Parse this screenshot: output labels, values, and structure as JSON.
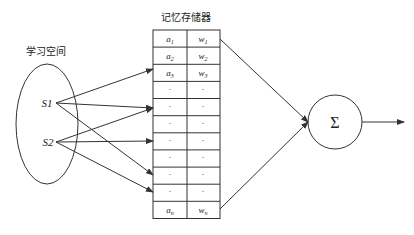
{
  "diagram": {
    "memory_title": "记忆存储器",
    "learning_space_label": "学习空间",
    "inputs": [
      {
        "label": "S",
        "suffix": "1"
      },
      {
        "label": "S",
        "suffix": "2"
      }
    ],
    "memory_rows": [
      {
        "a": "a",
        "a_sub": "1",
        "w": "w",
        "w_sub": "1"
      },
      {
        "a": "a",
        "a_sub": "2",
        "w": "w",
        "w_sub": "2"
      },
      {
        "a": "a",
        "a_sub": "3",
        "w": "w",
        "w_sub": "3"
      },
      {
        "a": "·",
        "a_sub": "",
        "w": "·",
        "w_sub": ""
      },
      {
        "a": "·",
        "a_sub": "",
        "w": "·",
        "w_sub": ""
      },
      {
        "a": "·",
        "a_sub": "",
        "w": "·",
        "w_sub": ""
      },
      {
        "a": "·",
        "a_sub": "",
        "w": "·",
        "w_sub": ""
      },
      {
        "a": "·",
        "a_sub": "",
        "w": "·",
        "w_sub": ""
      },
      {
        "a": "·",
        "a_sub": "",
        "w": "·",
        "w_sub": ""
      },
      {
        "a": "·",
        "a_sub": "",
        "w": "·",
        "w_sub": ""
      },
      {
        "a": "a",
        "a_sub": "n",
        "w": "w",
        "w_sub": "n"
      }
    ],
    "sum_symbol": "Σ",
    "colors": {
      "stroke": "#333333",
      "text": "#222222",
      "background": "#ffffff"
    }
  }
}
